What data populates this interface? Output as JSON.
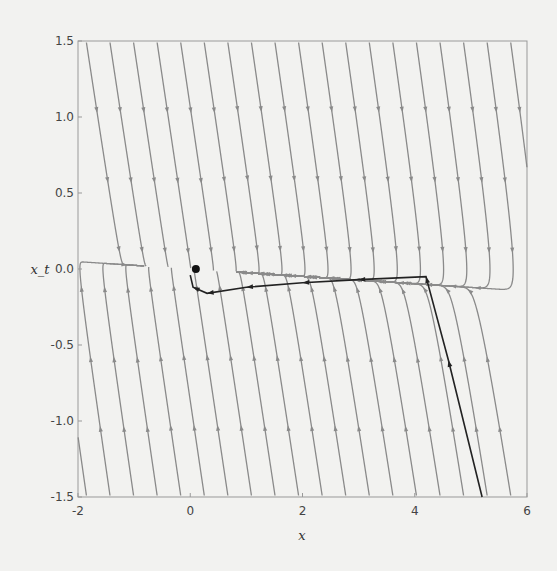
{
  "chart_data": {
    "type": "streamplot",
    "title": "",
    "xlabel": "x",
    "ylabel": "x_t",
    "xlim": [
      -2,
      6
    ],
    "ylim": [
      -1.5,
      1.5
    ],
    "xticks": [
      "-2",
      "0",
      "2",
      "4",
      "6"
    ],
    "yticks": [
      "-1.5",
      "-1.0",
      "-0.5",
      "0.0",
      "0.5",
      "1.0",
      "1.5"
    ],
    "xtick_values": [
      -2,
      0,
      2,
      4,
      6
    ],
    "ytick_values": [
      -1.5,
      -1.0,
      -0.5,
      0.0,
      0.5,
      1.0,
      1.5
    ],
    "field": {
      "description": "damped oscillator phase portrait: dx/dt = x_t, dx_t/dt = -k x - b x_t",
      "k": 0.06,
      "b": 2.5
    },
    "fixed_point": [
      0.1,
      0.0
    ],
    "trajectory": {
      "start": [
        5.2,
        -1.5
      ],
      "points": [
        [
          5.2,
          -1.5
        ],
        [
          4.6,
          -0.6
        ],
        [
          4.2,
          -0.05
        ],
        [
          3.0,
          -0.07
        ],
        [
          2.0,
          -0.09
        ],
        [
          1.0,
          -0.12
        ],
        [
          0.3,
          -0.16
        ],
        [
          0.05,
          -0.12
        ],
        [
          0.0,
          -0.04
        ]
      ]
    },
    "colors": {
      "stream": "#8a8a8a",
      "trajectory": "#222222",
      "axis": "#888888"
    }
  }
}
